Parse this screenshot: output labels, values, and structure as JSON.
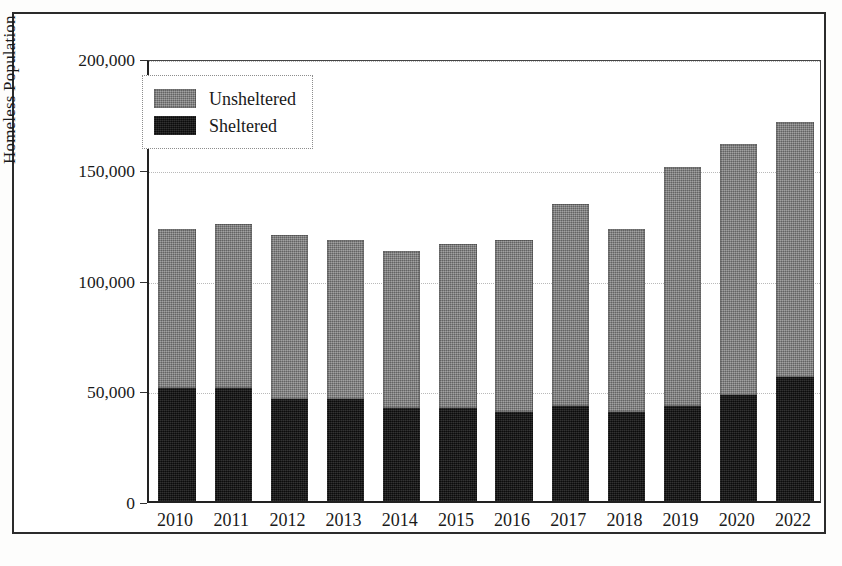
{
  "chart_data": {
    "type": "bar",
    "subtype": "stacked-bar",
    "title": "",
    "xlabel": "",
    "ylabel": "Homeless Population",
    "categories": [
      "2010",
      "2011",
      "2012",
      "2013",
      "2014",
      "2015",
      "2016",
      "2017",
      "2018",
      "2019",
      "2020",
      "2022"
    ],
    "series": [
      {
        "name": "Sheltered",
        "color": "#151515",
        "values": [
          51000,
          51000,
          46000,
          46000,
          42000,
          42000,
          40000,
          43000,
          40000,
          43000,
          48000,
          56000
        ]
      },
      {
        "name": "Unsheltered",
        "color": "#7d7d7d",
        "values": [
          72000,
          74000,
          74000,
          72000,
          71000,
          74000,
          78000,
          91000,
          83000,
          108000,
          113000,
          115000
        ]
      }
    ],
    "totals": [
      123000,
      125000,
      120000,
      118000,
      113000,
      116000,
      118000,
      134000,
      123000,
      151000,
      161000,
      171000
    ],
    "ylim": [
      0,
      200000
    ],
    "ytick_values": [
      0,
      50000,
      100000,
      150000,
      200000
    ],
    "ytick_labels": [
      "0",
      "50,000",
      "100,000",
      "150,000",
      "200,000"
    ],
    "grid": true,
    "grid_axis": "y",
    "legend_position": "top-left",
    "legend_entries": [
      "Unsheltered",
      "Sheltered"
    ],
    "stack_order_top_to_bottom": [
      "Unsheltered",
      "Sheltered"
    ]
  },
  "legend": {
    "items": [
      {
        "label": "Unsheltered",
        "swatch": "unsheltered-swatch"
      },
      {
        "label": "Sheltered",
        "swatch": "sheltered-swatch"
      }
    ]
  },
  "axes": {
    "y_title": "Homeless Population"
  },
  "colors": {
    "unsheltered": "#7d7d7d",
    "sheltered": "#151515",
    "frame": "#2b2b2b",
    "gridline": "#b9b9b9",
    "background": "#ffffff"
  }
}
